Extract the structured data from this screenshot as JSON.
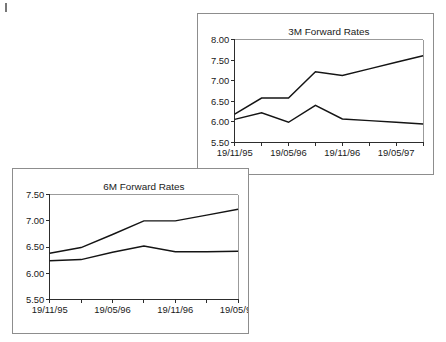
{
  "page": {
    "background_color": "#ffffff",
    "width": 446,
    "height": 342,
    "artifact_label": "scan-speck"
  },
  "panels": [
    {
      "id": "3m",
      "title": "3M Forward Rates",
      "border_color": "#8d8d8d"
    },
    {
      "id": "6m",
      "title": "6M Forward Rates",
      "border_color": "#8d8d8d"
    }
  ],
  "chart_data": [
    {
      "type": "line",
      "title": "3M Forward Rates",
      "xlabel": "",
      "ylabel": "",
      "ylim": [
        5.5,
        8.0
      ],
      "ytick_step": 0.5,
      "ytick_labels": [
        "5.50",
        "6.00",
        "6.50",
        "7.00",
        "7.50",
        "8.00"
      ],
      "ytick_values": [
        5.5,
        6.0,
        6.5,
        7.0,
        7.5,
        8.0
      ],
      "x": [
        0,
        1,
        2,
        3,
        4,
        5,
        6,
        7
      ],
      "xtick_positions": [
        0,
        1,
        2,
        3,
        4,
        5,
        6,
        7
      ],
      "xtick_labels": [
        "19/11/95",
        "",
        "19/05/96",
        "",
        "19/11/96",
        "",
        "19/05/97",
        ""
      ],
      "xtick_labels_shown": [
        "19/11/95",
        "19/05/96",
        "19/11/96",
        "19/05/97"
      ],
      "grid": false,
      "legend": "none",
      "line_color": "#141414",
      "series": [
        {
          "name": "upper",
          "values": [
            6.19,
            6.58,
            6.58,
            7.22,
            7.13,
            7.29,
            7.45,
            7.61
          ]
        },
        {
          "name": "lower",
          "values": [
            6.06,
            6.22,
            5.99,
            6.4,
            6.07,
            6.03,
            5.99,
            5.95
          ]
        }
      ]
    },
    {
      "type": "line",
      "title": "6M Forward Rates",
      "xlabel": "",
      "ylabel": "",
      "ylim": [
        5.5,
        7.5
      ],
      "ytick_step": 0.5,
      "ytick_labels": [
        "5.50",
        "6.00",
        "6.50",
        "7.00",
        "7.50"
      ],
      "ytick_values": [
        5.5,
        6.0,
        6.5,
        7.0,
        7.5
      ],
      "x": [
        0,
        1,
        2,
        3,
        4,
        5,
        6
      ],
      "xtick_positions": [
        0,
        1,
        2,
        3,
        4,
        5,
        6
      ],
      "xtick_labels": [
        "19/11/95",
        "",
        "19/05/96",
        "",
        "19/11/96",
        "",
        "19/05/97"
      ],
      "xtick_labels_shown": [
        "19/11/95",
        "19/05/96",
        "19/11/96",
        "19/05/97"
      ],
      "grid": false,
      "legend": "none",
      "line_color": "#141414",
      "series": [
        {
          "name": "upper",
          "values": [
            6.38,
            6.49,
            6.74,
            7.0,
            7.0,
            7.11,
            7.22
          ]
        },
        {
          "name": "lower",
          "values": [
            6.24,
            6.26,
            6.4,
            6.52,
            6.41,
            6.41,
            6.42
          ]
        }
      ]
    }
  ]
}
